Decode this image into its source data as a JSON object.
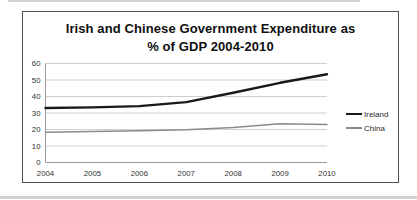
{
  "chart_data": {
    "type": "line",
    "title": "Irish and Chinese Government Expenditure as % of GDP 2004-2010",
    "title_line1": "Irish and Chinese Government Expenditure as",
    "title_line2": "% of GDP 2004-2010",
    "categories": [
      "2004",
      "2005",
      "2006",
      "2007",
      "2008",
      "2009",
      "2010"
    ],
    "series": [
      {
        "name": "Ireland",
        "values": [
          33,
          33.4,
          34.2,
          36.6,
          42.3,
          48.3,
          53.5
        ],
        "color": "#1a1a1a",
        "stroke_width": 2.4
      },
      {
        "name": "China",
        "values": [
          18.3,
          18.7,
          19.2,
          19.9,
          21.2,
          23.5,
          23
        ],
        "color": "#8a8a8a",
        "stroke_width": 1.5
      }
    ],
    "xlabel": "",
    "ylabel": "",
    "ylim": [
      0,
      60
    ],
    "ytick_step": 10,
    "yticks": [
      "0",
      "10",
      "20",
      "30",
      "40",
      "50",
      "60"
    ],
    "grid": true,
    "legend_position": "right",
    "colors": {
      "grid": "#c9c9c9",
      "axis": "#9b9b9b",
      "tick_text": "#303030",
      "title_text": "#0f0f0f",
      "frame_border": "#4f4f4f",
      "background": "#ffffff"
    }
  }
}
